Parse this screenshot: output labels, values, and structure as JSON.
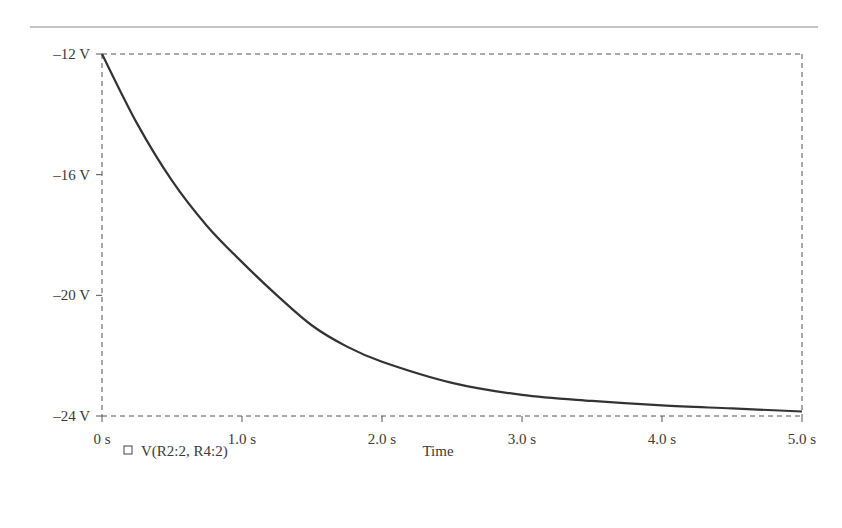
{
  "chart_data": {
    "type": "line",
    "title": "",
    "xlabel": "Time",
    "ylabel": "",
    "xlim": [
      0,
      5.0
    ],
    "ylim": [
      -24,
      -12
    ],
    "grid": false,
    "legend_position": "bottom-left",
    "x_ticks": [
      0,
      1.0,
      2.0,
      3.0,
      4.0,
      5.0
    ],
    "x_tick_labels": [
      "0 s",
      "1.0 s",
      "2.0 s",
      "3.0 s",
      "4.0 s",
      "5.0 s"
    ],
    "y_ticks": [
      -12,
      -16,
      -20,
      -24
    ],
    "y_tick_labels": [
      "–12 V",
      "–16 V",
      "–20 V",
      "–24 V"
    ],
    "series": [
      {
        "name": "V(R2:2, R4:2)",
        "color": "#333333",
        "x": [
          0,
          0.25,
          0.5,
          0.75,
          1.0,
          1.25,
          1.5,
          1.75,
          2.0,
          2.5,
          3.0,
          3.5,
          4.0,
          4.5,
          5.0
        ],
        "values": [
          -12.0,
          -14.3,
          -16.2,
          -17.7,
          -18.9,
          -20.0,
          -21.0,
          -21.7,
          -22.2,
          -22.9,
          -23.3,
          -23.5,
          -23.65,
          -23.75,
          -23.85
        ]
      }
    ]
  },
  "legend": {
    "marker_symbol": "□",
    "series_label": "V(R2:2, R4:2)"
  },
  "axis": {
    "x_title": "Time"
  }
}
